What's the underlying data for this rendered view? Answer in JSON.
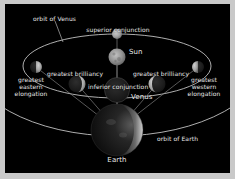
{
  "diagram": {
    "title_visible": false,
    "background_color": "#000000",
    "border_color": "#c9c9c9",
    "text_color": "#e8e8e8",
    "orbit_line_color": "#d8d8d8",
    "sightline_color": "#8d8d8d"
  },
  "bodies": {
    "sun": {
      "label": "Sun",
      "color": "#8e8e8e"
    },
    "earth": {
      "label": "Earth",
      "color": "#141414",
      "limb_color": "#c8c8c8"
    },
    "venus_center_label": "Venus"
  },
  "orbits": [
    {
      "name": "orbit-of-venus",
      "label": "orbit of Venus"
    },
    {
      "name": "orbit-of-earth",
      "label": "orbit of Earth"
    }
  ],
  "positions": [
    {
      "id": "superior-conjunction",
      "label": "superior conjunction",
      "phase": "full"
    },
    {
      "id": "greatest-eastern-elongation",
      "label": "greatest\neastern\nelongation",
      "phase": "half-lit-right"
    },
    {
      "id": "greatest-brilliancy-east",
      "label": "greatest brilliancy",
      "phase": "crescent-lit-right"
    },
    {
      "id": "inferior-conjunction",
      "label": "inferior conjunction",
      "phase": "new"
    },
    {
      "id": "greatest-brilliancy-west",
      "label": "greatest brilliancy",
      "phase": "crescent-lit-left"
    },
    {
      "id": "greatest-western-elongation",
      "label": "greatest\nwestern\nelongation",
      "phase": "half-lit-left"
    }
  ],
  "labels": {
    "orbit_of_venus": "orbit of Venus",
    "superior_conjunction": "superior conjunction",
    "sun": "Sun",
    "greatest_brilliancy_left": "greatest brilliancy",
    "greatest_brilliancy_right": "greatest brilliancy",
    "inferior_conjunction": "inferior conjunction",
    "venus": "Venus",
    "greatest_eastern_elongation_l1": "greatest",
    "greatest_eastern_elongation_l2": "eastern",
    "greatest_eastern_elongation_l3": "elongation",
    "greatest_western_elongation_l1": "greatest",
    "greatest_western_elongation_l2": "western",
    "greatest_western_elongation_l3": "elongation",
    "orbit_of_earth": "orbit of Earth",
    "earth": "Earth"
  }
}
